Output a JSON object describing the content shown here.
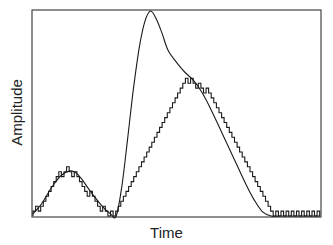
{
  "chart_data": {
    "type": "line",
    "title": "",
    "xlabel": "Time",
    "ylabel": "Amplitude",
    "xlim": [
      0,
      100
    ],
    "ylim": [
      0,
      100
    ],
    "grid": false,
    "legend": null,
    "ticks": {
      "x": [],
      "y": []
    },
    "series": [
      {
        "name": "analog signal",
        "style": "smooth",
        "x": [
          0,
          3,
          7,
          10,
          13,
          15,
          17,
          20,
          24,
          27,
          29,
          31,
          33,
          35,
          37,
          39,
          41,
          43,
          45,
          47,
          50,
          53,
          56,
          59,
          62,
          65,
          68,
          71,
          74,
          77,
          80,
          83,
          86,
          89,
          92,
          95,
          98,
          100
        ],
        "y": [
          1,
          6,
          15,
          20,
          22,
          21,
          18,
          12,
          5,
          1,
          0,
          15,
          38,
          62,
          82,
          95,
          100,
          96,
          89,
          81,
          75,
          70,
          66,
          60,
          52,
          43,
          34,
          25,
          16,
          8,
          2,
          0,
          0,
          0,
          0,
          0,
          0,
          0
        ]
      },
      {
        "name": "staircase approximation",
        "style": "step",
        "step_size": 2.4,
        "x": [
          0,
          3,
          7,
          10,
          13,
          15,
          17,
          20,
          24,
          27,
          29,
          31,
          33,
          35,
          37,
          39,
          41,
          43,
          45,
          47,
          50,
          53,
          56,
          59,
          62,
          65,
          68,
          71,
          74,
          77,
          80,
          83,
          86,
          89,
          92,
          95,
          98,
          100
        ],
        "y": [
          1,
          5,
          14,
          20,
          22,
          20,
          17,
          11,
          5,
          2,
          0,
          7,
          16,
          25,
          34,
          43,
          52,
          61,
          70,
          77,
          74,
          69,
          66,
          63,
          59,
          51,
          42,
          33,
          24,
          15,
          7,
          1,
          1,
          1,
          1,
          1,
          1,
          1
        ]
      }
    ],
    "annotations": []
  }
}
